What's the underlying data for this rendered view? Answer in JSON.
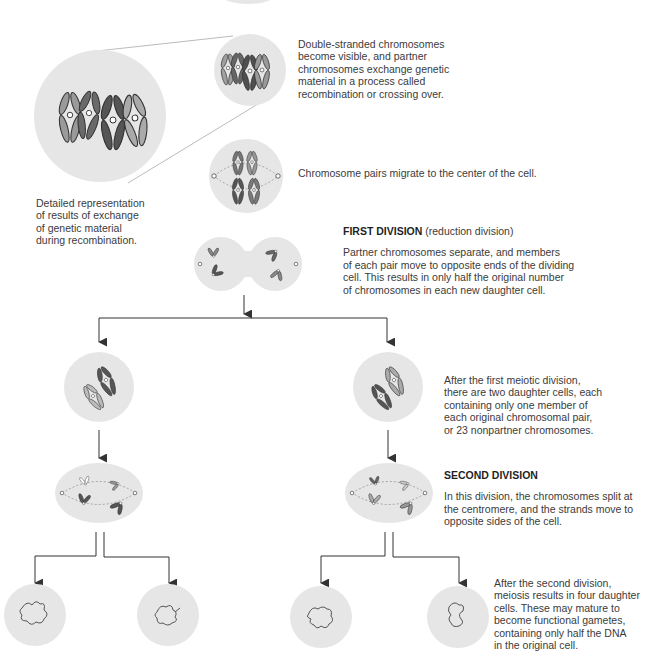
{
  "captions": {
    "recombination": [
      "Double-stranded chromosomes",
      "become visible, and partner",
      "chromosomes exchange genetic",
      "material in a process called",
      "recombination or crossing over."
    ],
    "detail": [
      "Detailed representation",
      "of results of exchange",
      "of genetic material",
      "during recombination."
    ],
    "migrate": [
      "Chromosome pairs migrate to the center of the cell."
    ],
    "first_division": {
      "heading": "FIRST DIVISION",
      "subheading": "(reduction division)",
      "body": [
        "Partner chromosomes separate, and members",
        "of each pair move to opposite ends of the dividing",
        "cell. This results in only half the original number",
        "of chromosomes in each new daughter cell."
      ]
    },
    "after_first": [
      "After the first meiotic division,",
      "there are two daughter cells, each",
      "containing only one member of",
      "each original chromosomal pair,",
      "or 23 nonpartner chromosomes."
    ],
    "second_division": {
      "heading": "SECOND DIVISION",
      "body": [
        "In this division, the chromosomes split at",
        "the centromere, and the strands move to",
        "opposite sides of the cell."
      ]
    },
    "after_second": [
      "After the second division,",
      "meiosis results in four daughter",
      "cells. These may mature to",
      "become functional gametes,",
      "containing only half the DNA",
      "in the original cell."
    ]
  },
  "colors": {
    "cell_fill": "#e6e6e6",
    "chromosome_dark": "#5a5a5a",
    "chromosome_mid": "#8c8c8c",
    "chromosome_light": "#bdbdbd",
    "outline": "#333333",
    "arrow": "#333333",
    "zoom_line": "#bbbbbb"
  },
  "stages": [
    {
      "id": "recombination-cell"
    },
    {
      "id": "magnified-detail-cell"
    },
    {
      "id": "metaphase-1-cell"
    },
    {
      "id": "anaphase-1-cell"
    },
    {
      "id": "daughter-cell-left"
    },
    {
      "id": "daughter-cell-right"
    },
    {
      "id": "meiosis-2-cell-left"
    },
    {
      "id": "meiosis-2-cell-right"
    },
    {
      "id": "gamete-1"
    },
    {
      "id": "gamete-2"
    },
    {
      "id": "gamete-3"
    },
    {
      "id": "gamete-4"
    }
  ]
}
